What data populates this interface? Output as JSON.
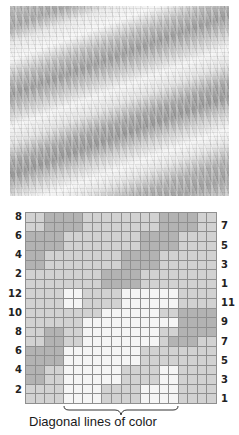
{
  "photo": {
    "subject": "knitted swatch with diagonal lines of color"
  },
  "chart_data": {
    "type": "heatmap",
    "title": "",
    "columns": 20,
    "rows": 20,
    "legend": {
      "D": "dark gray",
      "L": "light gray",
      "W": "white"
    },
    "colors": {
      "D": "#b3b3b3",
      "L": "#d2d2d2",
      "W": "#f5f5f5",
      "gridline": "#8f8f8f"
    },
    "left_labels": [
      "8",
      "6",
      "4",
      "2",
      "12",
      "10",
      "8",
      "6",
      "4",
      "2"
    ],
    "right_labels": [
      "7",
      "5",
      "3",
      "1",
      "11",
      "9",
      "7",
      "5",
      "3",
      "1"
    ],
    "grid": [
      "LLDDDDLLLLLLLLDDDDLL",
      "LLDDDDLLLLLLLLDDDDLL",
      "DDDDLLLLLLLLDDDDLLLL",
      "DDDDLLLLLLLLDDDDLLLL",
      "DDLLLLLLLLDDDDLLLLLL",
      "DDLLLLLLLLDDDDLLLLLL",
      "LLLLLLLLDDDDLLLLLLLL",
      "LLLLLLLLDDDDLLLLLLLL",
      "LLLLWWLLLLWWWWWWLLLL",
      "LLLLWWLLLLWWWWWWLLLL",
      "LLLLLLLLWWWWWWLLDDDD",
      "LLLLLLWWWWWWWWWWDDDD",
      "LLDDLLWWWWWWWWLLDDDD",
      "LLDDLLWWWWWWWWLDDDLL",
      "DDDDWWWWWWWWLLLLLLLL",
      "DDDDWWWWWWWWLLLLLLLL",
      "DDLLWWWWWWLLLLWWLLLL",
      "DDLLWWWWWWLLLLWWLLLL",
      "LLLLWWWWLLLLWWWWLLLL",
      "LLLLWWWWLLLLWWWWLLLL"
    ],
    "annotation": {
      "text": "Diagonal lines of color",
      "brace_columns": [
        5,
        16
      ]
    }
  },
  "caption": "Diagonal lines of color"
}
